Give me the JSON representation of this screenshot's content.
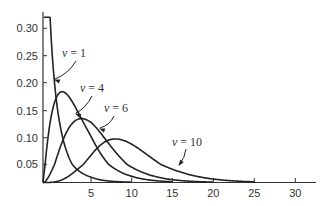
{
  "chart_data": {
    "type": "line",
    "title": "",
    "xlabel": "",
    "ylabel": "",
    "xlim": [
      0,
      32
    ],
    "ylim": [
      0,
      0.32
    ],
    "grid": false,
    "legend": "inline labels with arrows",
    "x_ticks": [
      5,
      10,
      15,
      20,
      25,
      30
    ],
    "x_tick_labels": [
      "5",
      "10",
      "15",
      "20",
      "25",
      "30"
    ],
    "y_ticks": [
      0.05,
      0.1,
      0.15,
      0.2,
      0.25,
      0.3
    ],
    "y_tick_labels": [
      "0.05",
      "0.10",
      "0.15",
      "0.20",
      "0.25",
      "0.30"
    ],
    "series": [
      {
        "name": "ν = 1",
        "dof": 1,
        "peak": {
          "x": 0,
          "y": "→∞"
        },
        "points": [
          [
            0.3,
            0.627
          ],
          [
            0.5,
            0.439
          ],
          [
            1,
            0.242
          ],
          [
            2,
            0.104
          ],
          [
            3,
            0.051
          ],
          [
            4,
            0.027
          ],
          [
            5,
            0.015
          ],
          [
            7,
            0.005
          ],
          [
            10,
            0.001
          ]
        ]
      },
      {
        "name": "ν = 4",
        "dof": 4,
        "peak": {
          "x": 2,
          "y": 0.184
        },
        "points": [
          [
            0,
            0
          ],
          [
            1,
            0.152
          ],
          [
            2,
            0.184
          ],
          [
            3,
            0.167
          ],
          [
            4,
            0.135
          ],
          [
            6,
            0.075
          ],
          [
            8,
            0.037
          ],
          [
            10,
            0.017
          ],
          [
            15,
            0.002
          ]
        ]
      },
      {
        "name": "ν = 6",
        "dof": 6,
        "peak": {
          "x": 4,
          "y": 0.135
        },
        "points": [
          [
            0,
            0
          ],
          [
            1,
            0.038
          ],
          [
            2,
            0.092
          ],
          [
            4,
            0.135
          ],
          [
            6,
            0.112
          ],
          [
            8,
            0.073
          ],
          [
            10,
            0.042
          ],
          [
            15,
            0.007
          ],
          [
            20,
            0.001
          ]
        ]
      },
      {
        "name": "ν = 10",
        "dof": 10,
        "peak": {
          "x": 8,
          "y": 0.098
        },
        "points": [
          [
            0,
            0
          ],
          [
            2,
            0.015
          ],
          [
            4,
            0.054
          ],
          [
            6,
            0.088
          ],
          [
            8,
            0.098
          ],
          [
            10,
            0.088
          ],
          [
            12,
            0.067
          ],
          [
            15,
            0.036
          ],
          [
            20,
            0.008
          ],
          [
            25,
            0.001
          ]
        ]
      }
    ],
    "annotations": [
      {
        "text": "ν = 1",
        "points_to_x": 1.3
      },
      {
        "text": "ν = 4",
        "points_to_x": 3.6
      },
      {
        "text": "ν = 6",
        "points_to_x": 6.2
      },
      {
        "text": "ν = 10",
        "points_to_x": 14.5
      }
    ]
  },
  "labels": {
    "nu1": {
      "sym": "ν",
      "rest": " = 1"
    },
    "nu4": {
      "sym": "ν",
      "rest": " = 4"
    },
    "nu6": {
      "sym": "ν",
      "rest": " = 6"
    },
    "nu10": {
      "sym": "ν",
      "rest": " = 10"
    }
  },
  "style": {
    "line_color": "#222222",
    "axis_color": "#333333",
    "background": "#ffffff"
  }
}
